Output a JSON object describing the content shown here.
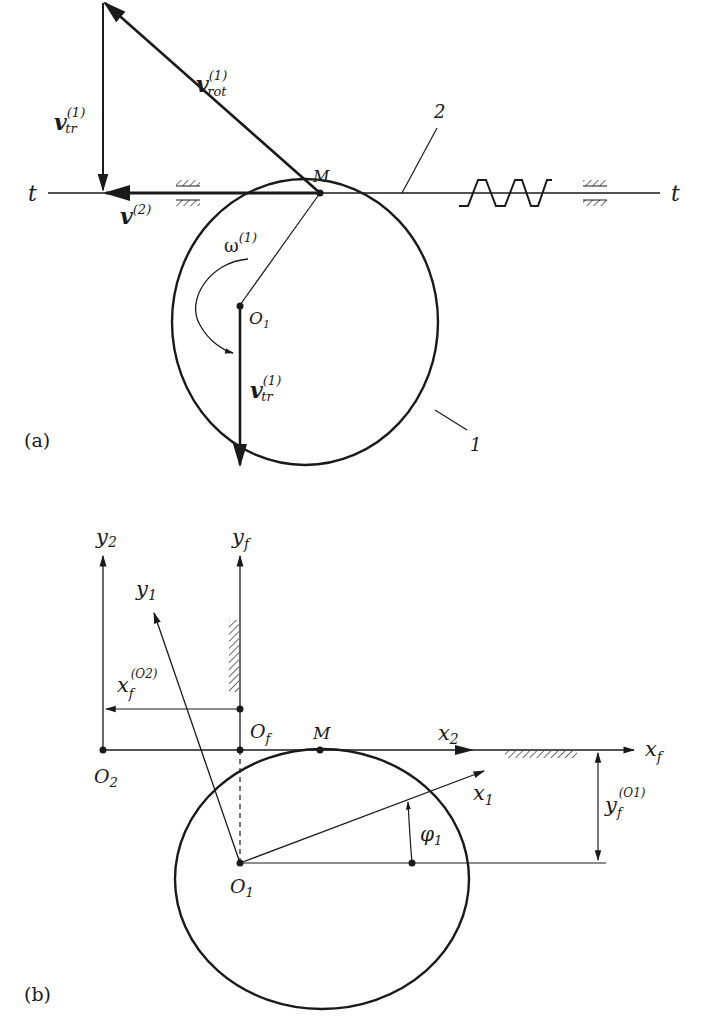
{
  "panels": {
    "a": {
      "label": "(a)",
      "axis_labels": {
        "t_left": "t",
        "t_right": "t"
      },
      "point_M": "M",
      "point_O1": "O",
      "point_O1_sub": "1",
      "part_1": "1",
      "part_2": "2",
      "vectors": {
        "v_rot": {
          "base": "v",
          "sup": "(1)",
          "sub": "rot"
        },
        "v_tr_top": {
          "base": "v",
          "sup": "(1)",
          "sub": "tr"
        },
        "v_tr_bottom": {
          "base": "v",
          "sup": "(1)",
          "sub": "tr"
        },
        "v2": {
          "base": "v",
          "sup": "(2)"
        },
        "omega": {
          "base": "ω",
          "sup": "(1)"
        }
      }
    },
    "b": {
      "label": "(b)",
      "axes": {
        "y2": {
          "base": "y",
          "sub": "2"
        },
        "yf": {
          "base": "y",
          "sub": "f"
        },
        "y1": {
          "base": "y",
          "sub": "1"
        },
        "x2": {
          "base": "x",
          "sub": "2"
        },
        "xf": {
          "base": "x",
          "sub": "f"
        },
        "x1": {
          "base": "x",
          "sub": "1"
        }
      },
      "points": {
        "O2": {
          "base": "O",
          "sub": "2"
        },
        "Of": {
          "base": "O",
          "sub": "f"
        },
        "O1": {
          "base": "O",
          "sub": "1"
        },
        "M": "M"
      },
      "dimensions": {
        "xf_O2": {
          "base": "x",
          "sub": "f",
          "sup": "(O2)"
        },
        "yf_O1": {
          "base": "y",
          "sub": "f",
          "sup": "(O1)"
        }
      },
      "angle": {
        "base": "φ",
        "sub": "1"
      }
    }
  }
}
